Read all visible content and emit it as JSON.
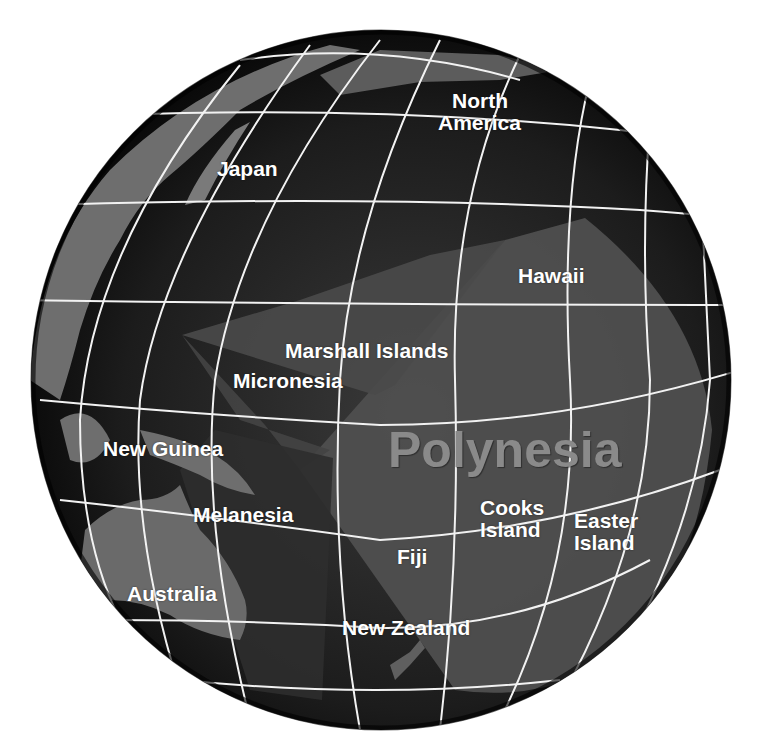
{
  "map": {
    "type": "orthographic globe",
    "subject": "Pacific Ocean island regions",
    "colors": {
      "ocean": "#151515",
      "land": "#6e6e6e",
      "polynesia_zone": "#4f4f4f",
      "micronesia_zone": "#4a4a4a",
      "melanesia_zone": "#2c2c2c",
      "graticule": "#f2f2f2",
      "label": "#ffffff",
      "region_label": "#8a8a8a"
    },
    "labels": [
      {
        "id": "north-america",
        "text": "North\nAmerica",
        "line1": "North",
        "line2": "America",
        "x": 438,
        "y": 90
      },
      {
        "id": "japan",
        "text": "Japan",
        "x": 217,
        "y": 158
      },
      {
        "id": "hawaii",
        "text": "Hawaii",
        "x": 518,
        "y": 265
      },
      {
        "id": "marshall-islands",
        "text": "Marshall Islands",
        "x": 285,
        "y": 340
      },
      {
        "id": "micronesia",
        "text": "Micronesia",
        "x": 233,
        "y": 370
      },
      {
        "id": "new-guinea",
        "text": "New Guinea",
        "x": 103,
        "y": 438
      },
      {
        "id": "polynesia",
        "text": "Polynesia",
        "x": 388,
        "y": 425
      },
      {
        "id": "melanesia",
        "text": "Melanesia",
        "x": 193,
        "y": 504
      },
      {
        "id": "cooks-island",
        "line1": "Cooks",
        "line2": "Island",
        "x": 480,
        "y": 497
      },
      {
        "id": "easter-island",
        "line1": "Easter",
        "line2": "Island",
        "x": 574,
        "y": 510
      },
      {
        "id": "fiji",
        "text": "Fiji",
        "x": 397,
        "y": 546
      },
      {
        "id": "australia",
        "text": "Australia",
        "x": 127,
        "y": 583
      },
      {
        "id": "new-zealand",
        "text": "New Zealand",
        "x": 342,
        "y": 617
      }
    ]
  }
}
